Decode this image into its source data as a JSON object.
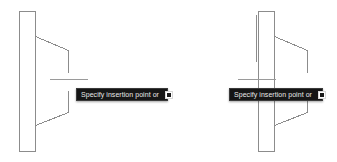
{
  "app": {
    "name": "cad-drawing-editor",
    "background_color": "#ffffff"
  },
  "drawings": [
    {
      "id": "drawing-left",
      "name": "wireframe-profile-left",
      "line_color": "#8c8c8c",
      "accent_line_color": "#9a9a9a",
      "geometry": {
        "column": {
          "x": 19,
          "y": 11,
          "width": 16,
          "height": 140
        },
        "flange_top": [
          [
            35,
            36
          ],
          [
            68,
            50
          ],
          [
            68,
            72
          ]
        ],
        "flange_bottom": [
          [
            35,
            125
          ],
          [
            68,
            112
          ],
          [
            68,
            90
          ]
        ],
        "centerline": [
          [
            50,
            79
          ],
          [
            88,
            79
          ]
        ],
        "inner_vertical": [
          [
            35,
            36
          ],
          [
            35,
            125
          ]
        ]
      }
    },
    {
      "id": "drawing-right",
      "name": "wireframe-profile-right",
      "line_color": "#8c8c8c",
      "accent_line_color": "#9a9a9a",
      "geometry": {
        "column": {
          "x": 90,
          "y": 11,
          "width": 16,
          "height": 140
        },
        "flange_top": [
          [
            106,
            36
          ],
          [
            139,
            50
          ],
          [
            139,
            72
          ]
        ],
        "flange_bottom": [
          [
            106,
            125
          ],
          [
            139,
            112
          ],
          [
            139,
            90
          ]
        ],
        "centerline": [
          [
            70,
            79
          ],
          [
            108,
            79
          ]
        ],
        "inner_vertical": [
          [
            88,
            15
          ],
          [
            88,
            62
          ]
        ]
      }
    }
  ],
  "tooltips": [
    {
      "id": "tooltip-left",
      "prompt": "Specify insertion point or",
      "icon": "dropdown-indicator-icon",
      "background_color": "#151515",
      "text_color": "#e8e8e8"
    },
    {
      "id": "tooltip-right",
      "prompt": "Specify insertion point or",
      "icon": "dropdown-indicator-icon",
      "background_color": "#151515",
      "text_color": "#e8e8e8"
    }
  ]
}
